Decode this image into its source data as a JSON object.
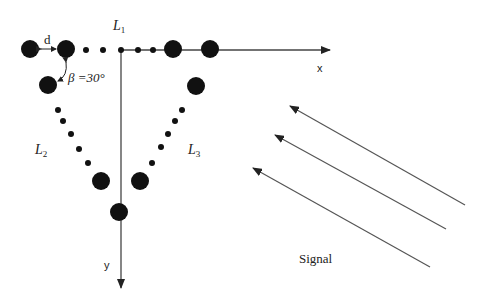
{
  "diagram": {
    "title_labels": {
      "L1": {
        "main": "L",
        "sub": "1"
      },
      "L2": {
        "main": "L",
        "sub": "2"
      },
      "L3": {
        "main": "L",
        "sub": "3"
      }
    },
    "spacing_label": "d",
    "angle_label": "β =30°",
    "axis_x_label": "x",
    "axis_y_label": "y",
    "signal_label": "Signal",
    "colors": {
      "element": "#111111",
      "axis": "#444444",
      "arrow": "#555555",
      "text": "#222222"
    },
    "large_elements": [
      [
        30,
        49
      ],
      [
        66,
        49
      ],
      [
        173,
        49
      ],
      [
        210,
        49
      ],
      [
        48,
        85
      ],
      [
        101,
        181
      ],
      [
        119,
        212
      ],
      [
        196,
        86
      ],
      [
        140,
        181
      ]
    ],
    "small_elements": [
      [
        86,
        50
      ],
      [
        103,
        50
      ],
      [
        121,
        50
      ],
      [
        138,
        50
      ],
      [
        153,
        50
      ],
      [
        58,
        110
      ],
      [
        63,
        121
      ],
      [
        71,
        134
      ],
      [
        79,
        149
      ],
      [
        88,
        163
      ],
      [
        182,
        110
      ],
      [
        175,
        121
      ],
      [
        168,
        134
      ],
      [
        161,
        147
      ],
      [
        152,
        163
      ]
    ],
    "signal_arrows": [
      {
        "from": [
          465,
          205
        ],
        "to": [
          290,
          106
        ]
      },
      {
        "from": [
          446,
          229
        ],
        "to": [
          275,
          135
        ]
      },
      {
        "from": [
          430,
          267
        ],
        "to": [
          253,
          168
        ]
      }
    ]
  }
}
